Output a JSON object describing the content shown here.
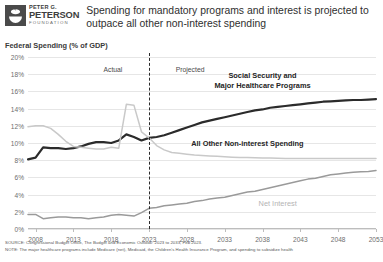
{
  "brand": {
    "line1": "PETER G.",
    "line2": "PETERSON",
    "line3": "FOUNDATION",
    "logo_icon": "peterson-bowl-icon"
  },
  "header": {
    "title": "Spending for mandatory programs and interest is projected to outpace all other non-interest spending"
  },
  "footer": {
    "source": "SOURCE: Congressional Budget Office, The Budget and Economic Outlook: 2023 to 2033, Feb 2023.",
    "note": "NOTE: The major healthcare programs include Medicare (net), Medicaid, the Children's Health Insurance Program, and spending to subsidize health"
  },
  "colors": {
    "social_security": "#2b2b2b",
    "all_other": "#c9c9c9",
    "net_interest": "#9a9a9a",
    "grid": "#e6e6e6",
    "axis": "#bdbdbd",
    "divider": "#2b2b2b"
  },
  "chart_data": {
    "type": "line",
    "title": "Spending for mandatory programs and interest is projected to outpace all other non-interest spending",
    "subtitle": "",
    "ylabel": "Federal Spending (% of GDP)",
    "xlabel": "",
    "ylim": [
      0,
      20
    ],
    "xlim": [
      2007,
      2053
    ],
    "grid": true,
    "legend_position": "inline-annotations",
    "ytick_labels": [
      "0%",
      "2%",
      "4%",
      "6%",
      "8%",
      "10%",
      "12%",
      "14%",
      "16%",
      "18%",
      "20%"
    ],
    "ytick_values": [
      0,
      2,
      4,
      6,
      8,
      10,
      12,
      14,
      16,
      18,
      20
    ],
    "xtick_labels": [
      "2008",
      "2013",
      "2018",
      "2023",
      "2028",
      "2033",
      "2038",
      "2043",
      "2048",
      "2053"
    ],
    "xtick_values": [
      2008,
      2013,
      2018,
      2023,
      2028,
      2033,
      2038,
      2043,
      2048,
      2053
    ],
    "annotations": [
      {
        "text": "Actual",
        "x": 2020,
        "y": 18.6
      },
      {
        "text": "Projected",
        "x": 2026,
        "y": 18.6
      }
    ],
    "divider": {
      "x": 2023,
      "label_left": "Actual",
      "label_right": "Projected"
    },
    "x": [
      2007,
      2008,
      2009,
      2010,
      2011,
      2012,
      2013,
      2014,
      2015,
      2016,
      2017,
      2018,
      2019,
      2020,
      2021,
      2022,
      2023,
      2024,
      2025,
      2026,
      2027,
      2028,
      2029,
      2030,
      2031,
      2032,
      2033,
      2034,
      2035,
      2036,
      2037,
      2038,
      2039,
      2040,
      2041,
      2042,
      2043,
      2044,
      2045,
      2046,
      2047,
      2048,
      2049,
      2050,
      2051,
      2052,
      2053
    ],
    "series": [
      {
        "name": "Social Security and Major Healthcare Programs",
        "color": "#2b2b2b",
        "label_lines": [
          "Social Security and",
          "Major Healthcare Programs"
        ],
        "label_x": 2038,
        "label_y": 17.2,
        "values": [
          8.1,
          8.3,
          9.5,
          9.4,
          9.4,
          9.3,
          9.4,
          9.6,
          9.9,
          10.1,
          10.1,
          10.0,
          10.3,
          11.0,
          10.7,
          10.3,
          10.6,
          10.7,
          10.9,
          11.2,
          11.5,
          11.8,
          12.1,
          12.4,
          12.6,
          12.8,
          13.0,
          13.2,
          13.4,
          13.6,
          13.8,
          13.9,
          14.1,
          14.2,
          14.3,
          14.4,
          14.5,
          14.6,
          14.7,
          14.8,
          14.85,
          14.9,
          14.95,
          15.0,
          15.0,
          15.05,
          15.1
        ]
      },
      {
        "name": "All Other Non-interest Spending",
        "color": "#c9c9c9",
        "label_lines": [
          "All Other Non-interest Spending"
        ],
        "label_x": 2036,
        "label_y": 9.9,
        "values": [
          11.9,
          12.0,
          12.0,
          11.7,
          11.0,
          10.2,
          9.6,
          9.5,
          9.4,
          9.3,
          9.3,
          9.5,
          9.4,
          14.5,
          14.4,
          11.3,
          10.6,
          9.7,
          9.2,
          8.9,
          8.8,
          8.7,
          8.6,
          8.55,
          8.5,
          8.45,
          8.4,
          8.35,
          8.3,
          8.3,
          8.28,
          8.25,
          8.25,
          8.22,
          8.2,
          8.2,
          8.2,
          8.2,
          8.2,
          8.2,
          8.2,
          8.2,
          8.2,
          8.2,
          8.2,
          8.2,
          8.2
        ]
      },
      {
        "name": "Net Interest",
        "color": "#9a9a9a",
        "label_lines": [
          "Net Interest"
        ],
        "label_x": 2040,
        "label_y": 2.9,
        "values": [
          1.7,
          1.7,
          1.2,
          1.3,
          1.4,
          1.4,
          1.3,
          1.3,
          1.2,
          1.3,
          1.4,
          1.6,
          1.7,
          1.6,
          1.5,
          1.9,
          2.4,
          2.5,
          2.7,
          2.8,
          2.9,
          3.0,
          3.2,
          3.3,
          3.5,
          3.6,
          3.7,
          3.9,
          4.1,
          4.3,
          4.4,
          4.6,
          4.8,
          5.0,
          5.2,
          5.4,
          5.6,
          5.8,
          5.9,
          6.1,
          6.3,
          6.4,
          6.5,
          6.6,
          6.65,
          6.7,
          6.8
        ]
      }
    ]
  }
}
